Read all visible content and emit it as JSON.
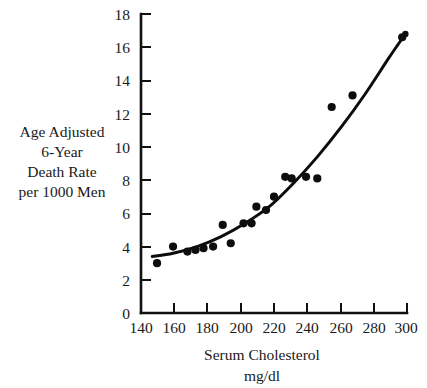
{
  "chart_data": {
    "type": "scatter",
    "title": "",
    "subtitle": "",
    "xlabel": "Serum Cholesterol",
    "xlabel_units": "mg/dl",
    "ylabel_lines": [
      "Age Adjusted",
      "6-Year",
      "Death Rate",
      "per 1000 Men"
    ],
    "xlim": [
      140,
      306
    ],
    "ylim": [
      0,
      18
    ],
    "xticks": [
      140,
      160,
      180,
      200,
      220,
      240,
      260,
      280,
      300
    ],
    "yticks": [
      0,
      2,
      4,
      6,
      8,
      10,
      12,
      14,
      16,
      18
    ],
    "xtick_labels": [
      "140",
      "160",
      "180",
      "200",
      "220",
      "240",
      "260",
      "280",
      "300"
    ],
    "ytick_labels": [
      "0",
      "2",
      "4",
      "6",
      "8",
      "10",
      "12",
      "14",
      "16",
      "18"
    ],
    "grid": false,
    "legend": null,
    "marker_color": "#0d0d0d",
    "curve_color": "#0d0d0d",
    "axis_color": "#111111",
    "background_color": "#ffffff",
    "points": [
      {
        "x": 150,
        "y": 3.0
      },
      {
        "x": 160,
        "y": 4.0
      },
      {
        "x": 169,
        "y": 3.7
      },
      {
        "x": 174,
        "y": 3.8
      },
      {
        "x": 179,
        "y": 3.9
      },
      {
        "x": 185,
        "y": 4.0
      },
      {
        "x": 191,
        "y": 5.3
      },
      {
        "x": 196,
        "y": 4.2
      },
      {
        "x": 204,
        "y": 5.4
      },
      {
        "x": 209,
        "y": 5.4
      },
      {
        "x": 212,
        "y": 6.4
      },
      {
        "x": 218,
        "y": 6.2
      },
      {
        "x": 223,
        "y": 7.0
      },
      {
        "x": 230,
        "y": 8.2
      },
      {
        "x": 234,
        "y": 8.1
      },
      {
        "x": 243,
        "y": 8.2
      },
      {
        "x": 250,
        "y": 8.1
      },
      {
        "x": 259,
        "y": 12.4
      },
      {
        "x": 272,
        "y": 13.1
      },
      {
        "x": 303,
        "y": 16.6
      }
    ],
    "series": [
      {
        "name": "fitted curve",
        "type": "line",
        "x": [
          147,
          160,
          175,
          190,
          205,
          220,
          235,
          250,
          265,
          280,
          295,
          305
        ],
        "y": [
          3.4,
          3.6,
          4.0,
          4.6,
          5.4,
          6.4,
          7.8,
          9.4,
          11.2,
          13.2,
          15.4,
          16.8
        ]
      }
    ],
    "annotations": []
  },
  "figure": {
    "name": "serum-cholesterol-death-rate-scatter"
  }
}
